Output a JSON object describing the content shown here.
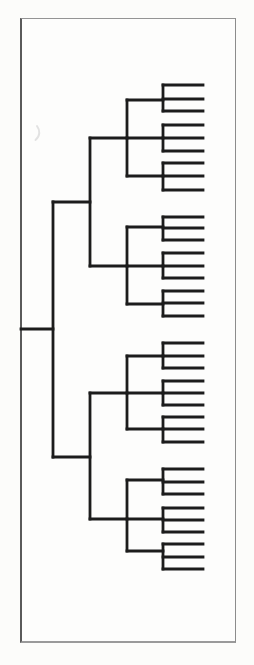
{
  "page": {
    "width": 254,
    "height": 665,
    "background": "#fcfcfa"
  },
  "frame": {
    "x": 20,
    "y": 18,
    "width": 216,
    "height": 625,
    "fill": "#fdfdfc",
    "border_top_color": "#949494",
    "border_right_color": "#8c8c8c",
    "border_bottom_color": "#9a9a9a",
    "border_left_color": "#5a5a5a",
    "border_top_width": 1,
    "border_right_width": 1,
    "border_bottom_width": 2,
    "border_left_width": 2
  },
  "dendrogram": {
    "type": "dendrogram",
    "orientation": "root-left-leaves-right",
    "leaf_count": 36,
    "group_count": 12,
    "quadrant_count": 4,
    "line_color": "#1c1c1c",
    "line_width": 2.8,
    "levels_x": {
      "root_start": 21,
      "root": 53,
      "half": 90,
      "quadrant": 127,
      "group": 163,
      "leaf_end": 203
    },
    "root": {
      "stem_y": 329,
      "span": [
        202,
        457
      ]
    },
    "halves": [
      {
        "stem_y": 202,
        "span": [
          138,
          266
        ]
      },
      {
        "stem_y": 457,
        "span": [
          393,
          519
        ]
      }
    ],
    "quadrants": [
      {
        "stem_y": 138,
        "span": [
          100,
          176
        ]
      },
      {
        "stem_y": 266,
        "span": [
          227,
          304
        ]
      },
      {
        "stem_y": 393,
        "span": [
          356,
          429
        ]
      },
      {
        "stem_y": 519,
        "span": [
          480,
          551
        ]
      }
    ],
    "groups": [
      {
        "stem_y": 100,
        "leaves": [
          85,
          99,
          111
        ]
      },
      {
        "stem_y": 138,
        "leaves": [
          125,
          138,
          151
        ]
      },
      {
        "stem_y": 176,
        "leaves": [
          163,
          176,
          190
        ]
      },
      {
        "stem_y": 227,
        "leaves": [
          217,
          228,
          240
        ]
      },
      {
        "stem_y": 266,
        "leaves": [
          253,
          266,
          278
        ]
      },
      {
        "stem_y": 304,
        "leaves": [
          291,
          303,
          316
        ]
      },
      {
        "stem_y": 356,
        "leaves": [
          343,
          356,
          368
        ]
      },
      {
        "stem_y": 393,
        "leaves": [
          381,
          393,
          405
        ]
      },
      {
        "stem_y": 429,
        "leaves": [
          417,
          429,
          442
        ]
      },
      {
        "stem_y": 480,
        "leaves": [
          469,
          482,
          494
        ]
      },
      {
        "stem_y": 519,
        "leaves": [
          508,
          520,
          532
        ]
      },
      {
        "stem_y": 551,
        "leaves": [
          544,
          557,
          569
        ]
      }
    ]
  },
  "artifact": {
    "path": "M37 126 c3 4 3.5 10 -1.5 14",
    "color": "#e2e2e2",
    "width": 2
  }
}
